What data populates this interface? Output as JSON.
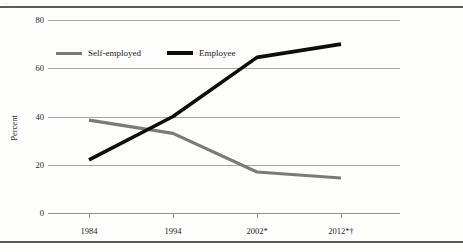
{
  "page": {
    "top_rule": "horizontal-rule",
    "bottom_rule": "horizontal-rule",
    "cropped_caption": "......."
  },
  "axis": {
    "y_title": "Percent",
    "y_ticks": [
      "80",
      "60",
      "40",
      "20",
      "0"
    ],
    "x_ticks": [
      "1984",
      "1994",
      "2002*",
      "2012*†"
    ]
  },
  "legend": {
    "items": [
      {
        "label": "Self-employed",
        "color": "#7a7a7a"
      },
      {
        "label": "Employee",
        "color": "#0d0d0d"
      }
    ]
  },
  "chart_data": {
    "type": "line",
    "title": "",
    "subtitle": "",
    "xlabel": "",
    "ylabel": "Percent",
    "x": [
      "1984",
      "1994",
      "2002*",
      "2012*†"
    ],
    "categories": [
      "1984",
      "1994",
      "2002*",
      "2012*†"
    ],
    "ylim": [
      0,
      80
    ],
    "yticks": [
      0,
      20,
      40,
      60,
      80
    ],
    "grid": "horizontal",
    "legend_position": "top-left-inside",
    "series": [
      {
        "name": "Self-employed",
        "color": "#7a7a7a",
        "values": [
          38.5,
          33.0,
          17.0,
          14.5
        ]
      },
      {
        "name": "Employee",
        "color": "#0d0d0d",
        "values": [
          22.0,
          40.0,
          64.5,
          70.0
        ]
      }
    ],
    "annotations": [
      "* asterisk footnote marker on 2002 and 2012",
      "† dagger footnote marker on 2012"
    ]
  }
}
